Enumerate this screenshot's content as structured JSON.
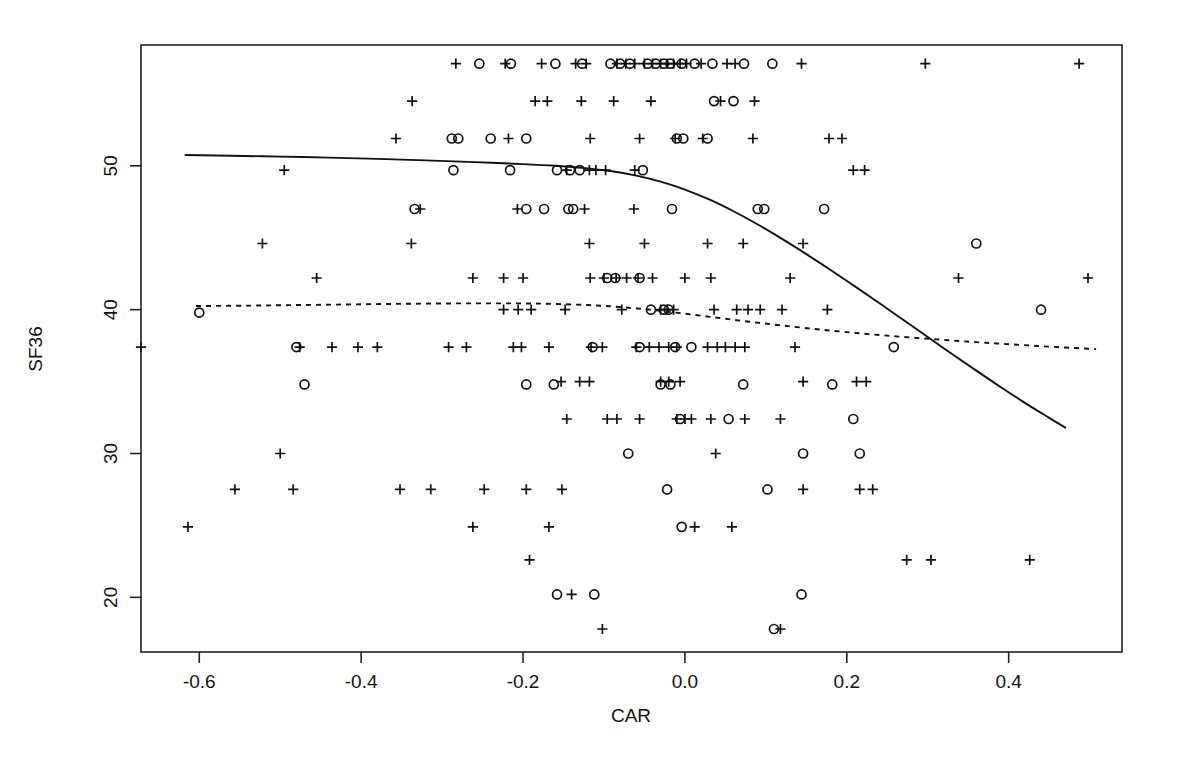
{
  "figure": {
    "width": 1181,
    "height": 767,
    "background": "#ffffff",
    "ink_color": "#111111"
  },
  "plot_area": {
    "left": 141,
    "top": 45,
    "right": 1122,
    "bottom": 652
  },
  "chart_data": {
    "type": "scatter",
    "title": "",
    "xlabel": "CAR",
    "ylabel": "SF36",
    "xlim": [
      -0.672,
      0.54
    ],
    "ylim": [
      16.2,
      58.4
    ],
    "grid": false,
    "legend_position": "none",
    "xticks": [
      -0.6,
      -0.4,
      -0.2,
      0.0,
      0.2,
      0.4
    ],
    "xticklabels": [
      "-0.6",
      "-0.4",
      "-0.2",
      "0.0",
      "0.2",
      "0.4"
    ],
    "yticks": [
      20,
      30,
      40,
      50
    ],
    "yticklabels": [
      "20",
      "30",
      "40",
      "50"
    ],
    "marker_types": [
      "plus",
      "circle"
    ],
    "series": [
      {
        "name": "plus-markers",
        "marker": "plus",
        "points": [
          [
            -0.283,
            57.1
          ],
          [
            -0.222,
            57.1
          ],
          [
            -0.177,
            57.1
          ],
          [
            -0.135,
            57.1
          ],
          [
            -0.122,
            57.1
          ],
          [
            -0.084,
            57.1
          ],
          [
            -0.073,
            57.1
          ],
          [
            -0.062,
            57.1
          ],
          [
            -0.05,
            57.1
          ],
          [
            -0.04,
            57.1
          ],
          [
            -0.03,
            57.1
          ],
          [
            -0.022,
            57.1
          ],
          [
            -0.014,
            57.1
          ],
          [
            -0.006,
            57.1
          ],
          [
            0.002,
            57.1
          ],
          [
            0.02,
            57.1
          ],
          [
            0.052,
            57.1
          ],
          [
            0.062,
            57.1
          ],
          [
            0.144,
            57.1
          ],
          [
            0.297,
            57.1
          ],
          [
            0.487,
            57.1
          ],
          [
            -0.337,
            54.5
          ],
          [
            -0.185,
            54.5
          ],
          [
            -0.17,
            54.5
          ],
          [
            -0.128,
            54.5
          ],
          [
            -0.088,
            54.5
          ],
          [
            -0.042,
            54.5
          ],
          [
            0.044,
            54.5
          ],
          [
            0.086,
            54.5
          ],
          [
            -0.357,
            51.9
          ],
          [
            -0.218,
            51.9
          ],
          [
            -0.117,
            51.9
          ],
          [
            -0.056,
            51.9
          ],
          [
            -0.012,
            51.9
          ],
          [
            0.022,
            51.9
          ],
          [
            0.084,
            51.9
          ],
          [
            0.178,
            51.9
          ],
          [
            0.194,
            51.9
          ],
          [
            -0.495,
            49.7
          ],
          [
            -0.146,
            49.7
          ],
          [
            -0.118,
            49.7
          ],
          [
            -0.11,
            49.7
          ],
          [
            -0.098,
            49.7
          ],
          [
            -0.062,
            49.7
          ],
          [
            0.208,
            49.7
          ],
          [
            0.222,
            49.7
          ],
          [
            -0.327,
            47.0
          ],
          [
            -0.207,
            47.0
          ],
          [
            -0.063,
            47.0
          ],
          [
            -0.522,
            44.6
          ],
          [
            -0.338,
            44.6
          ],
          [
            -0.124,
            47.0
          ],
          [
            -0.118,
            44.6
          ],
          [
            -0.05,
            44.6
          ],
          [
            0.028,
            44.6
          ],
          [
            0.072,
            44.6
          ],
          [
            0.146,
            44.6
          ],
          [
            -0.455,
            42.2
          ],
          [
            -0.262,
            42.2
          ],
          [
            -0.224,
            42.2
          ],
          [
            -0.2,
            42.2
          ],
          [
            -0.117,
            42.2
          ],
          [
            -0.1,
            42.2
          ],
          [
            -0.085,
            42.2
          ],
          [
            -0.072,
            42.2
          ],
          [
            -0.058,
            42.2
          ],
          [
            -0.04,
            42.2
          ],
          [
            0.0,
            42.2
          ],
          [
            0.032,
            42.2
          ],
          [
            0.13,
            42.2
          ],
          [
            0.338,
            42.2
          ],
          [
            0.498,
            42.2
          ],
          [
            -0.224,
            40.0
          ],
          [
            -0.206,
            40.0
          ],
          [
            -0.19,
            40.0
          ],
          [
            -0.148,
            40.0
          ],
          [
            -0.078,
            40.0
          ],
          [
            -0.03,
            40.0
          ],
          [
            -0.022,
            40.0
          ],
          [
            -0.014,
            40.0
          ],
          [
            0.036,
            40.0
          ],
          [
            0.064,
            40.0
          ],
          [
            0.078,
            40.0
          ],
          [
            0.093,
            40.0
          ],
          [
            0.12,
            40.0
          ],
          [
            0.176,
            40.0
          ],
          [
            -0.672,
            37.4
          ],
          [
            -0.476,
            37.4
          ],
          [
            -0.436,
            37.4
          ],
          [
            -0.404,
            37.4
          ],
          [
            -0.38,
            37.4
          ],
          [
            -0.292,
            37.4
          ],
          [
            -0.27,
            37.4
          ],
          [
            -0.212,
            37.4
          ],
          [
            -0.202,
            37.4
          ],
          [
            -0.168,
            37.4
          ],
          [
            -0.116,
            37.4
          ],
          [
            -0.102,
            37.4
          ],
          [
            -0.06,
            37.4
          ],
          [
            -0.044,
            37.4
          ],
          [
            -0.032,
            37.4
          ],
          [
            -0.02,
            37.4
          ],
          [
            -0.01,
            37.4
          ],
          [
            0.028,
            37.4
          ],
          [
            0.04,
            37.4
          ],
          [
            0.05,
            37.4
          ],
          [
            0.062,
            37.4
          ],
          [
            0.074,
            37.4
          ],
          [
            0.136,
            37.4
          ],
          [
            -0.153,
            35.0
          ],
          [
            -0.13,
            35.0
          ],
          [
            -0.118,
            35.0
          ],
          [
            -0.03,
            35.0
          ],
          [
            -0.02,
            35.0
          ],
          [
            -0.006,
            35.0
          ],
          [
            0.146,
            35.0
          ],
          [
            0.212,
            35.0
          ],
          [
            0.224,
            35.0
          ],
          [
            -0.146,
            32.4
          ],
          [
            -0.096,
            32.4
          ],
          [
            -0.084,
            32.4
          ],
          [
            -0.056,
            32.4
          ],
          [
            -0.01,
            32.4
          ],
          [
            0.0,
            32.4
          ],
          [
            0.008,
            32.4
          ],
          [
            0.032,
            32.4
          ],
          [
            0.074,
            32.4
          ],
          [
            0.118,
            32.4
          ],
          [
            -0.5,
            30.0
          ],
          [
            0.038,
            30.0
          ],
          [
            -0.556,
            27.5
          ],
          [
            -0.484,
            27.5
          ],
          [
            -0.352,
            27.5
          ],
          [
            -0.314,
            27.5
          ],
          [
            -0.248,
            27.5
          ],
          [
            -0.196,
            27.5
          ],
          [
            -0.152,
            27.5
          ],
          [
            0.146,
            27.5
          ],
          [
            0.216,
            27.5
          ],
          [
            0.232,
            27.5
          ],
          [
            -0.614,
            24.9
          ],
          [
            -0.262,
            24.9
          ],
          [
            -0.168,
            24.9
          ],
          [
            0.012,
            24.9
          ],
          [
            0.058,
            24.9
          ],
          [
            -0.192,
            22.6
          ],
          [
            0.274,
            22.6
          ],
          [
            0.304,
            22.6
          ],
          [
            0.426,
            22.6
          ],
          [
            -0.14,
            20.2
          ],
          [
            -0.102,
            17.8
          ],
          [
            0.118,
            17.8
          ]
        ]
      },
      {
        "name": "circle-markers",
        "marker": "circle",
        "points": [
          [
            -0.254,
            57.1
          ],
          [
            -0.215,
            57.1
          ],
          [
            -0.16,
            57.1
          ],
          [
            -0.127,
            57.1
          ],
          [
            -0.092,
            57.1
          ],
          [
            -0.08,
            57.1
          ],
          [
            -0.068,
            57.1
          ],
          [
            -0.046,
            57.1
          ],
          [
            -0.036,
            57.1
          ],
          [
            -0.026,
            57.1
          ],
          [
            -0.018,
            57.1
          ],
          [
            -0.004,
            57.1
          ],
          [
            0.012,
            57.1
          ],
          [
            0.034,
            57.1
          ],
          [
            0.073,
            57.1
          ],
          [
            0.108,
            57.1
          ],
          [
            0.036,
            54.5
          ],
          [
            0.06,
            54.5
          ],
          [
            -0.288,
            51.9
          ],
          [
            -0.28,
            51.9
          ],
          [
            -0.24,
            51.9
          ],
          [
            -0.196,
            51.9
          ],
          [
            -0.01,
            51.9
          ],
          [
            -0.002,
            51.9
          ],
          [
            0.028,
            51.9
          ],
          [
            -0.286,
            49.7
          ],
          [
            -0.216,
            49.7
          ],
          [
            -0.158,
            49.7
          ],
          [
            -0.142,
            49.7
          ],
          [
            -0.13,
            49.7
          ],
          [
            -0.052,
            49.7
          ],
          [
            -0.334,
            47.0
          ],
          [
            -0.196,
            47.0
          ],
          [
            -0.174,
            47.0
          ],
          [
            -0.144,
            47.0
          ],
          [
            -0.138,
            47.0
          ],
          [
            -0.016,
            47.0
          ],
          [
            0.09,
            47.0
          ],
          [
            0.098,
            47.0
          ],
          [
            0.172,
            47.0
          ],
          [
            0.36,
            44.6
          ],
          [
            -0.096,
            42.2
          ],
          [
            -0.086,
            42.2
          ],
          [
            -0.056,
            42.2
          ],
          [
            -0.6,
            39.8
          ],
          [
            -0.042,
            40.0
          ],
          [
            -0.026,
            40.0
          ],
          [
            -0.02,
            40.0
          ],
          [
            0.44,
            40.0
          ],
          [
            -0.48,
            37.4
          ],
          [
            -0.114,
            37.4
          ],
          [
            -0.056,
            37.4
          ],
          [
            -0.012,
            37.4
          ],
          [
            0.008,
            37.4
          ],
          [
            0.258,
            37.4
          ],
          [
            -0.47,
            34.8
          ],
          [
            -0.196,
            34.8
          ],
          [
            -0.162,
            34.8
          ],
          [
            -0.03,
            34.8
          ],
          [
            -0.018,
            34.8
          ],
          [
            0.072,
            34.8
          ],
          [
            0.182,
            34.8
          ],
          [
            -0.006,
            32.4
          ],
          [
            0.054,
            32.4
          ],
          [
            0.208,
            32.4
          ],
          [
            -0.07,
            30.0
          ],
          [
            0.146,
            30.0
          ],
          [
            0.216,
            30.0
          ],
          [
            -0.022,
            27.5
          ],
          [
            0.102,
            27.5
          ],
          [
            -0.004,
            24.9
          ],
          [
            -0.158,
            20.2
          ],
          [
            -0.112,
            20.2
          ],
          [
            0.144,
            20.2
          ],
          [
            0.11,
            17.8
          ]
        ]
      }
    ],
    "fitted_curves": [
      {
        "name": "solid-curve",
        "style": "solid",
        "points": [
          [
            -0.617,
            50.75
          ],
          [
            -0.56,
            50.7
          ],
          [
            -0.5,
            50.64
          ],
          [
            -0.44,
            50.57
          ],
          [
            -0.38,
            50.48
          ],
          [
            -0.32,
            50.38
          ],
          [
            -0.26,
            50.26
          ],
          [
            -0.2,
            50.12
          ],
          [
            -0.16,
            50.0
          ],
          [
            -0.12,
            49.82
          ],
          [
            -0.09,
            49.62
          ],
          [
            -0.06,
            49.32
          ],
          [
            -0.03,
            48.9
          ],
          [
            0.0,
            48.35
          ],
          [
            0.03,
            47.66
          ],
          [
            0.06,
            46.84
          ],
          [
            0.09,
            45.92
          ],
          [
            0.12,
            44.92
          ],
          [
            0.15,
            43.86
          ],
          [
            0.18,
            42.76
          ],
          [
            0.21,
            41.62
          ],
          [
            0.24,
            40.46
          ],
          [
            0.27,
            39.28
          ],
          [
            0.3,
            38.1
          ],
          [
            0.33,
            36.92
          ],
          [
            0.36,
            35.76
          ],
          [
            0.39,
            34.62
          ],
          [
            0.42,
            33.52
          ],
          [
            0.45,
            32.48
          ],
          [
            0.47,
            31.8
          ]
        ]
      },
      {
        "name": "dashed-curve",
        "style": "dashed",
        "points": [
          [
            -0.604,
            40.25
          ],
          [
            -0.54,
            40.28
          ],
          [
            -0.48,
            40.32
          ],
          [
            -0.42,
            40.36
          ],
          [
            -0.36,
            40.4
          ],
          [
            -0.3,
            40.43
          ],
          [
            -0.24,
            40.44
          ],
          [
            -0.18,
            40.42
          ],
          [
            -0.12,
            40.32
          ],
          [
            -0.08,
            40.18
          ],
          [
            -0.04,
            39.98
          ],
          [
            0.0,
            39.72
          ],
          [
            0.04,
            39.44
          ],
          [
            0.08,
            39.16
          ],
          [
            0.12,
            38.9
          ],
          [
            0.16,
            38.66
          ],
          [
            0.2,
            38.44
          ],
          [
            0.24,
            38.24
          ],
          [
            0.28,
            38.06
          ],
          [
            0.32,
            37.9
          ],
          [
            0.36,
            37.74
          ],
          [
            0.4,
            37.6
          ],
          [
            0.44,
            37.46
          ],
          [
            0.48,
            37.34
          ],
          [
            0.508,
            37.26
          ]
        ]
      }
    ]
  }
}
